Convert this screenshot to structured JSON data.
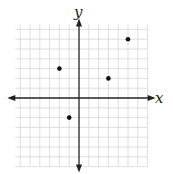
{
  "chart_data": {
    "type": "scatter",
    "title": "",
    "xlabel": "x",
    "ylabel": "y",
    "grid": true,
    "xlim": [
      -6.5,
      7
    ],
    "ylim": [
      -7,
      7.5
    ],
    "tick_step": 1,
    "tick_labels_shown": false,
    "series": [
      {
        "name": "points",
        "points": [
          {
            "x": -2,
            "y": 3
          },
          {
            "x": 3,
            "y": 2
          },
          {
            "x": 5,
            "y": 6
          },
          {
            "x": -1,
            "y": -2
          }
        ]
      }
    ],
    "legend": null
  },
  "style": {
    "grid_color": "#d6d6d6",
    "axis_color": "#222222",
    "point_color": "#111111"
  },
  "layout": {
    "origin_px": [
      79,
      98
    ],
    "unit_px": 9.8
  }
}
